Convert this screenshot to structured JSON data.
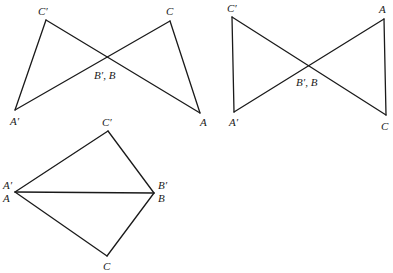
{
  "figures": [
    {
      "name": "top-left-bowtie",
      "vertices": {
        "C_prime": {
          "x": 46,
          "y": 20
        },
        "C": {
          "x": 170,
          "y": 21
        },
        "A_prime": {
          "x": 15,
          "y": 110
        },
        "A": {
          "x": 200,
          "y": 113
        }
      },
      "edges": [
        [
          "A_prime",
          "C_prime"
        ],
        [
          "C_prime",
          "A"
        ],
        [
          "A_prime",
          "C"
        ],
        [
          "C",
          "A"
        ]
      ],
      "labels": [
        {
          "text": "C′",
          "x": 38,
          "y": 15
        },
        {
          "text": "C",
          "x": 166,
          "y": 15
        },
        {
          "text": "A′",
          "x": 10,
          "y": 125
        },
        {
          "text": "A",
          "x": 200,
          "y": 126
        },
        {
          "text": "B′, B",
          "x": 94,
          "y": 79
        }
      ]
    },
    {
      "name": "top-right-bowtie",
      "vertices": {
        "C_prime": {
          "x": 232,
          "y": 17
        },
        "A": {
          "x": 384,
          "y": 19
        },
        "A_prime": {
          "x": 234,
          "y": 112
        },
        "C": {
          "x": 386,
          "y": 115
        }
      },
      "edges": [
        [
          "C_prime",
          "A_prime"
        ],
        [
          "C_prime",
          "C"
        ],
        [
          "A_prime",
          "A"
        ],
        [
          "A",
          "C"
        ]
      ],
      "labels": [
        {
          "text": "C′",
          "x": 227,
          "y": 12
        },
        {
          "text": "A",
          "x": 379,
          "y": 13
        },
        {
          "text": "A′",
          "x": 229,
          "y": 126
        },
        {
          "text": "C",
          "x": 381,
          "y": 130
        },
        {
          "text": "B′, B",
          "x": 296,
          "y": 86
        }
      ]
    },
    {
      "name": "bottom-kite",
      "vertices": {
        "C_prime": {
          "x": 108,
          "y": 131
        },
        "A": {
          "x": 15,
          "y": 192
        },
        "B": {
          "x": 154,
          "y": 193
        },
        "C": {
          "x": 107,
          "y": 256
        }
      },
      "edges": [
        [
          "A",
          "C_prime"
        ],
        [
          "C_prime",
          "B"
        ],
        [
          "A",
          "B"
        ],
        [
          "A",
          "C"
        ],
        [
          "C",
          "B"
        ]
      ],
      "labels": [
        {
          "text": "C′",
          "x": 102,
          "y": 126
        },
        {
          "text": "A′",
          "x": 3,
          "y": 189
        },
        {
          "text": "A",
          "x": 3,
          "y": 202
        },
        {
          "text": "B′",
          "x": 158,
          "y": 189
        },
        {
          "text": "B",
          "x": 158,
          "y": 202
        },
        {
          "text": "C",
          "x": 103,
          "y": 270
        }
      ]
    }
  ]
}
